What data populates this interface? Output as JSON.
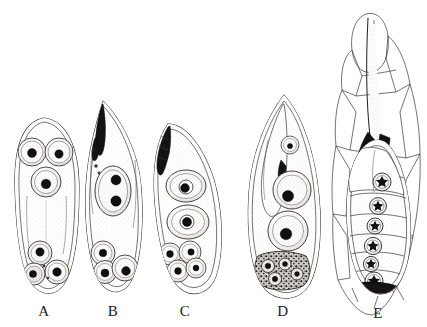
{
  "plate": {
    "title": "Comparative developmental stages A–E",
    "background_color": "#ffffff",
    "ink_color": "#2a2724",
    "nucleus_color": "#111010",
    "figure_count": 5,
    "style": "stippled line engraving / lithograph",
    "labels": [
      {
        "id": "A",
        "text": "A",
        "x": 44,
        "y": 316
      },
      {
        "id": "B",
        "text": "B",
        "x": 113,
        "y": 316
      },
      {
        "id": "C",
        "text": "C",
        "x": 185,
        "y": 316
      },
      {
        "id": "D",
        "text": "D",
        "x": 283,
        "y": 316
      },
      {
        "id": "E",
        "text": "E",
        "x": 378,
        "y": 318
      }
    ],
    "figures": [
      {
        "id": "A",
        "label": "A",
        "shape": "elongate ovoid, rounded at both ends",
        "apex": "rounded, no pigment",
        "upper_cells": 3,
        "lower_cells": 3,
        "nuclei_visible": 6,
        "dark_pigment_mass": false,
        "host_tissue_shown": false
      },
      {
        "id": "B",
        "label": "B",
        "shape": "lanceolate, sharply tapered apex",
        "apex": "acute point with dark pigment streak",
        "upper_cells": 1,
        "upper_cell_nuclei": 2,
        "lower_cells": 3,
        "nuclei_visible": 5,
        "dark_pigment_mass": true,
        "host_tissue_shown": false
      },
      {
        "id": "C",
        "label": "C",
        "shape": "asymmetric curved ovoid, obliquely bent",
        "apex": "narrow with banded dark streak",
        "upper_cells": 2,
        "lower_cells": 4,
        "nuclei_visible": 6,
        "dark_pigment_mass": true,
        "host_tissue_shown": false
      },
      {
        "id": "D",
        "label": "D",
        "shape": "broad ovoid, pointed apex",
        "apex": "acute point with internal sac",
        "upper_cells": 2,
        "lower_cells": 4,
        "nuclei_visible": 6,
        "dark_pigment_mass": true,
        "host_tissue_shown": false
      },
      {
        "id": "E",
        "label": "E",
        "shape": "elongate body embedded in host tissue",
        "apex": "long tapering tube with black wedge marks",
        "chambers": 6,
        "nuclei_visible": 6,
        "nucleus_type": "stellate rosette",
        "dark_pigment_mass": true,
        "host_tissue_shown": true,
        "host_tissue": "polygonal plant cell-wall network"
      }
    ]
  }
}
